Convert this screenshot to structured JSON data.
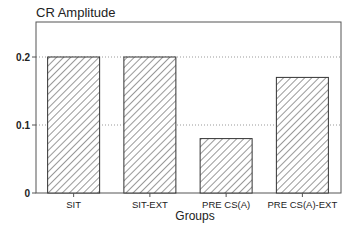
{
  "chart_data": {
    "type": "bar",
    "title": "CR Amplitude",
    "xlabel": "Groups",
    "ylabel": "CR Amplitude",
    "categories": [
      "SIT",
      "SIT-EXT",
      "PRE CS(A)",
      "PRE CS(A)-EXT"
    ],
    "values": [
      0.2,
      0.2,
      0.08,
      0.17
    ],
    "ylim": [
      0,
      0.25
    ],
    "yticks": [
      0,
      0.1,
      0.2
    ],
    "ytick_labels": [
      "0",
      "0.1",
      "0.2"
    ],
    "grid": "horizontal dotted at 0.1 and 0.2",
    "legend": "none",
    "bar_fill": "diagonal hatch",
    "colors": {
      "bar_stroke": "#333333",
      "hatch": "#444444",
      "grid": "#999999",
      "frame": "#555555"
    }
  }
}
